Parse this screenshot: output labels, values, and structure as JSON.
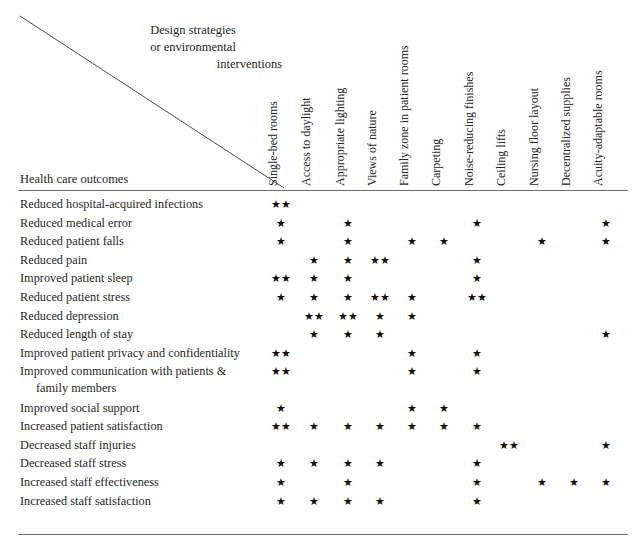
{
  "figure": {
    "corner_title_lines": [
      "Design strategies",
      "or environmental",
      "interventions"
    ],
    "row_axis_title": "Health care outcomes",
    "rule_color": "#6e6e6e",
    "star_glyph": "★",
    "text_color": "#1f1f1f"
  },
  "chart_data": {
    "type": "table",
    "title": "Design strategies or environmental interventions",
    "xlabel": "Design strategies or environmental interventions",
    "ylabel": "Health care outcomes",
    "grid": false,
    "legend": "",
    "columns": [
      "Single-bed rooms",
      "Access to daylight",
      "Appropriate lighting",
      "Views of nature",
      "Family zone in patient rooms",
      "Carpeting",
      "Noise-reducing finishes",
      "Ceiling lifts",
      "Nursing floor layout",
      "Decentralized supplies",
      "Acuity-adaptable rooms"
    ],
    "column_x": [
      281,
      314,
      348,
      380,
      412,
      444,
      477,
      509,
      542,
      574,
      606
    ],
    "rows": [
      {
        "label": "Reduced hospital-acquired infections",
        "label2": "",
        "marks": [
          2,
          0,
          0,
          0,
          0,
          0,
          0,
          0,
          0,
          0,
          0
        ]
      },
      {
        "label": "Reduced medical error",
        "label2": "",
        "marks": [
          1,
          0,
          1,
          0,
          0,
          0,
          1,
          0,
          0,
          0,
          1
        ]
      },
      {
        "label": "Reduced patient falls",
        "label2": "",
        "marks": [
          1,
          0,
          1,
          0,
          1,
          1,
          0,
          0,
          1,
          0,
          1
        ]
      },
      {
        "label": "Reduced pain",
        "label2": "",
        "marks": [
          0,
          1,
          1,
          2,
          0,
          0,
          1,
          0,
          0,
          0,
          0
        ]
      },
      {
        "label": "Improved patient sleep",
        "label2": "",
        "marks": [
          2,
          1,
          1,
          0,
          0,
          0,
          1,
          0,
          0,
          0,
          0
        ]
      },
      {
        "label": "Reduced patient stress",
        "label2": "",
        "marks": [
          1,
          1,
          1,
          2,
          1,
          0,
          2,
          0,
          0,
          0,
          0
        ]
      },
      {
        "label": "Reduced depression",
        "label2": "",
        "marks": [
          0,
          2,
          2,
          1,
          1,
          0,
          0,
          0,
          0,
          0,
          0
        ]
      },
      {
        "label": "Reduced length of stay",
        "label2": "",
        "marks": [
          0,
          1,
          1,
          1,
          0,
          0,
          0,
          0,
          0,
          0,
          1
        ]
      },
      {
        "label": "Improved patient privacy and confidentiality",
        "label2": "",
        "marks": [
          2,
          0,
          0,
          0,
          1,
          0,
          1,
          0,
          0,
          0,
          0
        ]
      },
      {
        "label": "Improved communication with patients &",
        "label2": "family members",
        "marks": [
          2,
          0,
          0,
          0,
          1,
          0,
          1,
          0,
          0,
          0,
          0
        ]
      },
      {
        "label": "Improved social support",
        "label2": "",
        "marks": [
          1,
          0,
          0,
          0,
          1,
          1,
          0,
          0,
          0,
          0,
          0
        ]
      },
      {
        "label": "Increased patient satisfaction",
        "label2": "",
        "marks": [
          2,
          1,
          1,
          1,
          1,
          1,
          1,
          0,
          0,
          0,
          0
        ]
      },
      {
        "label": "Decreased staff injuries",
        "label2": "",
        "marks": [
          0,
          0,
          0,
          0,
          0,
          0,
          0,
          2,
          0,
          0,
          1
        ]
      },
      {
        "label": "Decreased staff stress",
        "label2": "",
        "marks": [
          1,
          1,
          1,
          1,
          0,
          0,
          1,
          0,
          0,
          0,
          0
        ]
      },
      {
        "label": "Increased staff effectiveness",
        "label2": "",
        "marks": [
          1,
          0,
          1,
          0,
          0,
          0,
          1,
          0,
          1,
          1,
          1
        ]
      },
      {
        "label": "Increased staff satisfaction",
        "label2": "",
        "marks": [
          1,
          1,
          1,
          1,
          0,
          0,
          1,
          0,
          0,
          0,
          0
        ]
      }
    ]
  }
}
